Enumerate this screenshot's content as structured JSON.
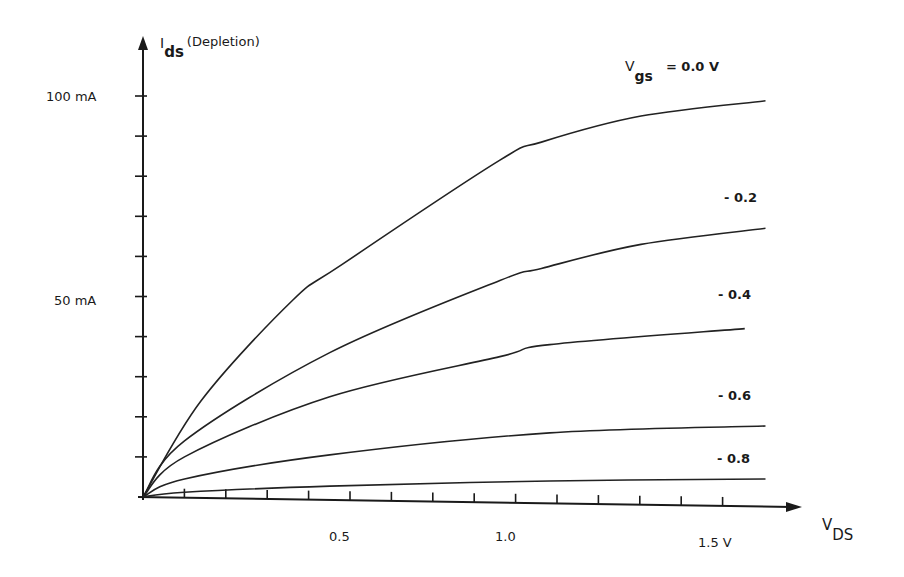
{
  "chart_data": {
    "type": "line",
    "title": "",
    "ylabel": {
      "main": "I",
      "sub": "ds",
      "suffix": "(Depletion)"
    },
    "xlabel": {
      "main": "V",
      "sub": "DS"
    },
    "ylim": [
      0,
      100
    ],
    "xlim": [
      0,
      1.5
    ],
    "grid": false,
    "y_tick_labels": [
      {
        "value": 100,
        "text": "100 mA"
      },
      {
        "value": 50,
        "text": "50 mA"
      }
    ],
    "y_minor_tick_step": 10,
    "x_tick_labels": [
      {
        "text": "0.5"
      },
      {
        "text": "1.0"
      },
      {
        "text": "1.5 V"
      }
    ],
    "x_minor_tick_step": 0.1,
    "x_minor_tick_count": 14,
    "legend_header": {
      "main": "V",
      "sub": "gs",
      "suffix": "= 0.0 V"
    },
    "series": [
      {
        "name": "0.0 V",
        "label": "",
        "x": [
          0,
          0.14,
          0.36,
          0.48,
          0.86,
          0.96,
          1.2,
          1.5
        ],
        "y": [
          0,
          24,
          49,
          58,
          84,
          88.5,
          95,
          98.8
        ]
      },
      {
        "name": "-0.2 V",
        "label": "- 0.2",
        "x": [
          0,
          0.1,
          0.45,
          0.86,
          0.96,
          1.2,
          1.5
        ],
        "y": [
          0,
          14,
          36,
          54,
          57,
          63,
          67
        ]
      },
      {
        "name": "-0.4 V",
        "label": "- 0.4",
        "x": [
          0,
          0.1,
          0.45,
          0.86,
          0.98,
          1.45
        ],
        "y": [
          0,
          10,
          25,
          35,
          38,
          42
        ]
      },
      {
        "name": "-0.6 V",
        "label": "- 0.6",
        "x": [
          0,
          0.1,
          0.45,
          0.98,
          1.5
        ],
        "y": [
          0,
          4.5,
          10.5,
          16,
          17.7
        ]
      },
      {
        "name": "-0.8 V",
        "label": "- 0.8",
        "x": [
          0,
          0.1,
          0.45,
          0.98,
          1.5
        ],
        "y": [
          0,
          1.2,
          2.7,
          4,
          4.5
        ]
      }
    ]
  }
}
